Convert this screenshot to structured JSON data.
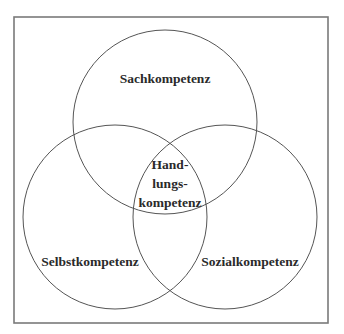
{
  "diagram": {
    "type": "venn",
    "colors": {
      "frame_stroke": "#7a7a7a",
      "circle_stroke": "#555555",
      "text": "#2a2a2a",
      "background": "#ffffff"
    },
    "sets": [
      {
        "id": "top",
        "label": "Sachkompetenz"
      },
      {
        "id": "left",
        "label": "Selbstkompetenz"
      },
      {
        "id": "right",
        "label": "Sozialkompetenz"
      }
    ],
    "intersection": {
      "label_lines": [
        "Hand-",
        "lungs-",
        "kompetenz"
      ]
    }
  }
}
